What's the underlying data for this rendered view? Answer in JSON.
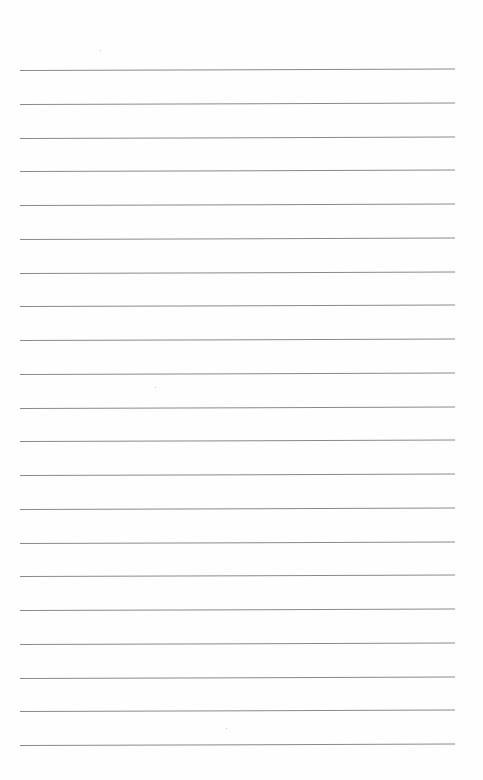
{
  "page": {
    "type": "lined-paper",
    "background": "#fefefe",
    "rule_color": "#8a8a8a",
    "rule_count": 21,
    "rule_start_y": 70,
    "rule_spacing": 33.75,
    "rule_left": 20,
    "rule_width": 435,
    "text": ""
  }
}
